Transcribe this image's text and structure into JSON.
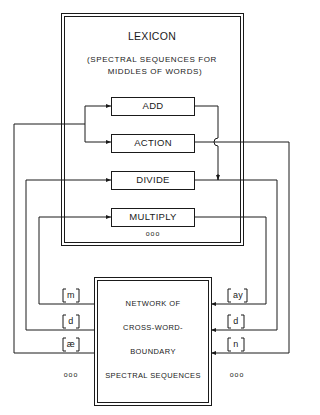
{
  "lexicon": {
    "title": "LEXICON",
    "subtitle_line1": "(SPECTRAL SEQUENCES FOR",
    "subtitle_line2": "MIDDLES OF WORDS)",
    "words": [
      {
        "label": "ADD"
      },
      {
        "label": "ACTION"
      },
      {
        "label": "DIVIDE"
      },
      {
        "label": "MULTIPLY"
      }
    ],
    "ellipsis": "ooo"
  },
  "network": {
    "line1": "NETWORK OF",
    "line2": "CROSS-WORD-",
    "line3": "BOUNDARY",
    "line4": "SPECTRAL SEQUENCES"
  },
  "left_phones": [
    {
      "label": "[m]"
    },
    {
      "label": "[d]"
    },
    {
      "label": "[æ]"
    }
  ],
  "right_phones": [
    {
      "label": "[ay]"
    },
    {
      "label": "[d]"
    },
    {
      "label": "[n]"
    }
  ],
  "left_ellipsis": "ooo",
  "right_ellipsis": "ooo",
  "colors": {
    "line": "#1a1a1a",
    "background": "#ffffff"
  }
}
